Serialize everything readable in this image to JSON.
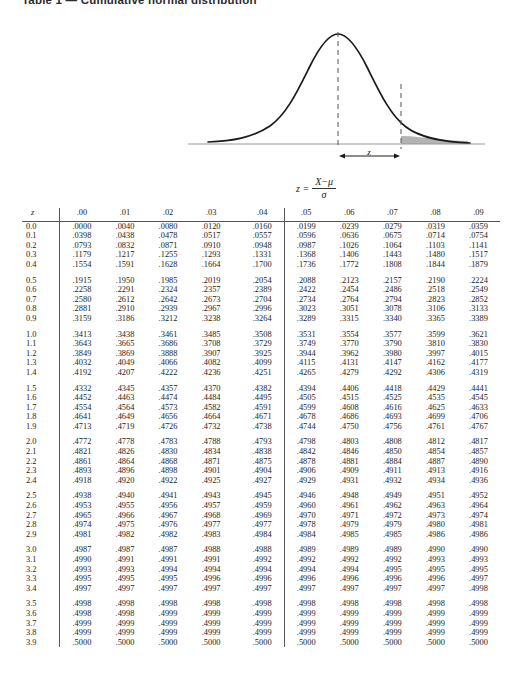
{
  "title": "Table 1 — Cumulative normal distribution",
  "figure": {
    "name": "normal-distribution-curve",
    "z_arrow_label": "z",
    "shaded_tail_description": "right tail beyond z",
    "curve_color": "#1a1a1a",
    "shade_color": "#b3b3b3",
    "axis_color": "#999999"
  },
  "formula": {
    "lhs": "z =",
    "numerator": "X−μ",
    "denominator": "σ"
  },
  "table": {
    "row_header_label": "z",
    "columns": [
      ".00",
      ".01",
      ".02",
      ".03",
      ".04",
      ".05",
      ".06",
      ".07",
      ".08",
      ".09"
    ],
    "split_after_column_index": 4,
    "rows": [
      {
        "z": "0.0",
        "values": [
          ".0000",
          ".0040",
          ".0080",
          ".0120",
          ".0160",
          ".0199",
          ".0239",
          ".0279",
          ".0319",
          ".0359"
        ]
      },
      {
        "z": "0.1",
        "values": [
          ".0398",
          ".0438",
          ".0478",
          ".0517",
          ".0557",
          ".0596",
          ".0636",
          ".0675",
          ".0714",
          ".0754"
        ]
      },
      {
        "z": "0.2",
        "values": [
          ".0793",
          ".0832",
          ".0871",
          ".0910",
          ".0948",
          ".0987",
          ".1026",
          ".1064",
          ".1103",
          ".1141"
        ]
      },
      {
        "z": "0.3",
        "values": [
          ".1179",
          ".1217",
          ".1255",
          ".1293",
          ".1331",
          ".1368",
          ".1406",
          ".1443",
          ".1480",
          ".1517"
        ]
      },
      {
        "z": "0.4",
        "values": [
          ".1554",
          ".1591",
          ".1628",
          ".1664",
          ".1700",
          ".1736",
          ".1772",
          ".1808",
          ".1844",
          ".1879"
        ]
      },
      {
        "z": "0.5",
        "values": [
          ".1915",
          ".1950",
          ".1985",
          ".2019",
          ".2054",
          ".2088",
          ".2123",
          ".2157",
          ".2190",
          ".2224"
        ]
      },
      {
        "z": "0.6",
        "values": [
          ".2258",
          ".2291",
          ".2324",
          ".2357",
          ".2389",
          ".2422",
          ".2454",
          ".2486",
          ".2518",
          ".2549"
        ]
      },
      {
        "z": "0.7",
        "values": [
          ".2580",
          ".2612",
          ".2642",
          ".2673",
          ".2704",
          ".2734",
          ".2764",
          ".2794",
          ".2823",
          ".2852"
        ]
      },
      {
        "z": "0.8",
        "values": [
          ".2881",
          ".2910",
          ".2939",
          ".2967",
          ".2996",
          ".3023",
          ".3051",
          ".3078",
          ".3106",
          ".3133"
        ]
      },
      {
        "z": "0.9",
        "values": [
          ".3159",
          ".3186",
          ".3212",
          ".3238",
          ".3264",
          ".3289",
          ".3315",
          ".3340",
          ".3365",
          ".3389"
        ]
      },
      {
        "z": "1.0",
        "values": [
          ".3413",
          ".3438",
          ".3461",
          ".3485",
          ".3508",
          ".3531",
          ".3554",
          ".3577",
          ".3599",
          ".3621"
        ]
      },
      {
        "z": "1.1",
        "values": [
          ".3643",
          ".3665",
          ".3686",
          ".3708",
          ".3729",
          ".3749",
          ".3770",
          ".3790",
          ".3810",
          ".3830"
        ]
      },
      {
        "z": "1.2",
        "values": [
          ".3849",
          ".3869",
          ".3888",
          ".3907",
          ".3925",
          ".3944",
          ".3962",
          ".3980",
          ".3997",
          ".4015"
        ]
      },
      {
        "z": "1.3",
        "values": [
          ".4032",
          ".4049",
          ".4066",
          ".4082",
          ".4099",
          ".4115",
          ".4131",
          ".4147",
          ".4162",
          ".4177"
        ]
      },
      {
        "z": "1.4",
        "values": [
          ".4192",
          ".4207",
          ".4222",
          ".4236",
          ".4251",
          ".4265",
          ".4279",
          ".4292",
          ".4306",
          ".4319"
        ]
      },
      {
        "z": "1.5",
        "values": [
          ".4332",
          ".4345",
          ".4357",
          ".4370",
          ".4382",
          ".4394",
          ".4406",
          ".4418",
          ".4429",
          ".4441"
        ]
      },
      {
        "z": "1.6",
        "values": [
          ".4452",
          ".4463",
          ".4474",
          ".4484",
          ".4495",
          ".4505",
          ".4515",
          ".4525",
          ".4535",
          ".4545"
        ]
      },
      {
        "z": "1.7",
        "values": [
          ".4554",
          ".4564",
          ".4573",
          ".4582",
          ".4591",
          ".4599",
          ".4608",
          ".4616",
          ".4625",
          ".4633"
        ]
      },
      {
        "z": "1.8",
        "values": [
          ".4641",
          ".4649",
          ".4656",
          ".4664",
          ".4671",
          ".4678",
          ".4686",
          ".4693",
          ".4699",
          ".4706"
        ]
      },
      {
        "z": "1.9",
        "values": [
          ".4713",
          ".4719",
          ".4726",
          ".4732",
          ".4738",
          ".4744",
          ".4750",
          ".4756",
          ".4761",
          ".4767"
        ]
      },
      {
        "z": "2.0",
        "values": [
          ".4772",
          ".4778",
          ".4783",
          ".4788",
          ".4793",
          ".4798",
          ".4803",
          ".4808",
          ".4812",
          ".4817"
        ]
      },
      {
        "z": "2.1",
        "values": [
          ".4821",
          ".4826",
          ".4830",
          ".4834",
          ".4838",
          ".4842",
          ".4846",
          ".4850",
          ".4854",
          ".4857"
        ]
      },
      {
        "z": "2.2",
        "values": [
          ".4861",
          ".4864",
          ".4868",
          ".4871",
          ".4875",
          ".4878",
          ".4881",
          ".4884",
          ".4887",
          ".4890"
        ]
      },
      {
        "z": "2.3",
        "values": [
          ".4893",
          ".4896",
          ".4898",
          ".4901",
          ".4904",
          ".4906",
          ".4909",
          ".4911",
          ".4913",
          ".4916"
        ]
      },
      {
        "z": "2.4",
        "values": [
          ".4918",
          ".4920",
          ".4922",
          ".4925",
          ".4927",
          ".4929",
          ".4931",
          ".4932",
          ".4934",
          ".4936"
        ]
      },
      {
        "z": "2.5",
        "values": [
          ".4938",
          ".4940",
          ".4941",
          ".4943",
          ".4945",
          ".4946",
          ".4948",
          ".4949",
          ".4951",
          ".4952"
        ]
      },
      {
        "z": "2.6",
        "values": [
          ".4953",
          ".4955",
          ".4956",
          ".4957",
          ".4959",
          ".4960",
          ".4961",
          ".4962",
          ".4963",
          ".4964"
        ]
      },
      {
        "z": "2.7",
        "values": [
          ".4965",
          ".4966",
          ".4967",
          ".4968",
          ".4969",
          ".4970",
          ".4971",
          ".4972",
          ".4973",
          ".4974"
        ]
      },
      {
        "z": "2.8",
        "values": [
          ".4974",
          ".4975",
          ".4976",
          ".4977",
          ".4977",
          ".4978",
          ".4979",
          ".4979",
          ".4980",
          ".4981"
        ]
      },
      {
        "z": "2.9",
        "values": [
          ".4981",
          ".4982",
          ".4982",
          ".4983",
          ".4984",
          ".4984",
          ".4985",
          ".4985",
          ".4986",
          ".4986"
        ]
      },
      {
        "z": "3.0",
        "values": [
          ".4987",
          ".4987",
          ".4987",
          ".4988",
          ".4988",
          ".4989",
          ".4989",
          ".4989",
          ".4990",
          ".4990"
        ]
      },
      {
        "z": "3.1",
        "values": [
          ".4990",
          ".4991",
          ".4991",
          ".4991",
          ".4992",
          ".4992",
          ".4992",
          ".4992",
          ".4993",
          ".4993"
        ]
      },
      {
        "z": "3.2",
        "values": [
          ".4993",
          ".4993",
          ".4994",
          ".4994",
          ".4994",
          ".4994",
          ".4994",
          ".4995",
          ".4995",
          ".4995"
        ]
      },
      {
        "z": "3.3",
        "values": [
          ".4995",
          ".4995",
          ".4995",
          ".4996",
          ".4996",
          ".4996",
          ".4996",
          ".4996",
          ".4996",
          ".4997"
        ]
      },
      {
        "z": "3.4",
        "values": [
          ".4997",
          ".4997",
          ".4997",
          ".4997",
          ".4997",
          ".4997",
          ".4997",
          ".4997",
          ".4997",
          ".4998"
        ]
      },
      {
        "z": "3.5",
        "values": [
          ".4998",
          ".4998",
          ".4998",
          ".4998",
          ".4998",
          ".4998",
          ".4998",
          ".4998",
          ".4998",
          ".4998"
        ]
      },
      {
        "z": "3.6",
        "values": [
          ".4998",
          ".4998",
          ".4999",
          ".4999",
          ".4999",
          ".4999",
          ".4999",
          ".4999",
          ".4999",
          ".4999"
        ]
      },
      {
        "z": "3.7",
        "values": [
          ".4999",
          ".4999",
          ".4999",
          ".4999",
          ".4999",
          ".4999",
          ".4999",
          ".4999",
          ".4999",
          ".4999"
        ]
      },
      {
        "z": "3.8",
        "values": [
          ".4999",
          ".4999",
          ".4999",
          ".4999",
          ".4999",
          ".4999",
          ".4999",
          ".4999",
          ".4999",
          ".4999"
        ]
      },
      {
        "z": "3.9",
        "values": [
          ".5000",
          ".5000",
          ".5000",
          ".5000",
          ".5000",
          ".5000",
          ".5000",
          ".5000",
          ".5000",
          ".5000"
        ]
      }
    ]
  }
}
